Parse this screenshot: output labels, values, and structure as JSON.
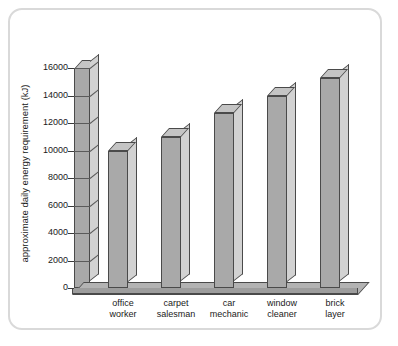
{
  "chart_data": {
    "type": "bar",
    "title": "",
    "xlabel": "",
    "ylabel": "approximate daily energy requirement (kJ)",
    "categories": [
      "office worker",
      "carpet salesman",
      "car mechanic",
      "window cleaner",
      "brick layer"
    ],
    "category_lines": [
      [
        "office",
        "worker"
      ],
      [
        "carpet",
        "salesman"
      ],
      [
        "car",
        "mechanic"
      ],
      [
        "window",
        "cleaner"
      ],
      [
        "brick",
        "layer"
      ]
    ],
    "values": [
      10000,
      11000,
      12700,
      14000,
      15300
    ],
    "ylim": [
      0,
      16000
    ],
    "ytick_values": [
      0,
      2000,
      4000,
      6000,
      8000,
      10000,
      12000,
      14000,
      16000
    ],
    "ytick_labels": [
      "0",
      "2000",
      "4000",
      "6000",
      "8000",
      "10000",
      "12000",
      "14000",
      "16000"
    ],
    "grid": true,
    "legend": "none",
    "style": "3d-bars",
    "colors": {
      "bar_front": "#a9a9a9",
      "bar_side": "#d2d2d2",
      "bar_top": "#c4c4c4",
      "outline": "#4a4a4a",
      "floor": "#b3b3b3",
      "frame_border": "#d9d9d9",
      "background": "#ffffff",
      "text": "#1a1a1a"
    }
  }
}
